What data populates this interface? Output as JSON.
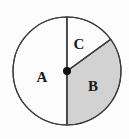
{
  "figure": {
    "background_color": "#fdfdfd",
    "outline_color": "#3a3a3a"
  },
  "chart_data": {
    "type": "pie",
    "title": "",
    "subtitle": "",
    "xlabel": "",
    "ylabel": "",
    "legend_position": "none",
    "grid": false,
    "center": {
      "x": 67,
      "y": 71
    },
    "radius": 54,
    "center_dot": {
      "visible": true,
      "radius": 4,
      "color": "#111111"
    },
    "angle_reference": "degrees measured counter-clockwise from positive x-axis (east = 0)",
    "categories": [
      "A",
      "B",
      "C"
    ],
    "values": [
      180,
      126,
      54
    ],
    "value_unit": "degrees",
    "slices": [
      {
        "label": "A",
        "start_angle": 90,
        "end_angle": 270,
        "sweep_degrees": 180,
        "fill": "#fcfcfc",
        "shaded": false,
        "label_x": 42,
        "label_y": 79
      },
      {
        "label": "B",
        "start_angle": 270,
        "end_angle": 396,
        "sweep_degrees": 126,
        "fill": "#d2d2d2",
        "shaded": true,
        "label_x": 93,
        "label_y": 88
      },
      {
        "label": "C",
        "start_angle": 36,
        "end_angle": 90,
        "sweep_degrees": 54,
        "fill": "#fcfcfc",
        "shaded": false,
        "label_x": 79,
        "label_y": 46
      }
    ],
    "radii_lines": [
      {
        "name": "vertical-up",
        "angle": 90
      },
      {
        "name": "vertical-down",
        "angle": 270
      },
      {
        "name": "slant-upper-right",
        "angle": 36
      }
    ]
  }
}
